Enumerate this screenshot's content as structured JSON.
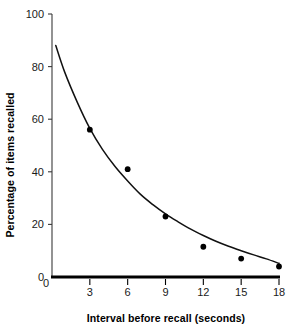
{
  "chart_data": {
    "type": "scatter",
    "title": "",
    "xlabel": "Interval before recall (seconds)",
    "ylabel": "Percentage of items recalled",
    "xlim": [
      0,
      18
    ],
    "ylim": [
      0,
      100
    ],
    "xticks": [
      0,
      3,
      6,
      9,
      12,
      15,
      18
    ],
    "xtick_labels": [
      "0",
      "3",
      "6",
      "9",
      "12",
      "15",
      "18"
    ],
    "yticks": [
      0,
      20,
      40,
      60,
      80,
      100
    ],
    "ytick_labels": [
      "0",
      "20",
      "40",
      "60",
      "80",
      "100"
    ],
    "grid": false,
    "legend": false,
    "series": [
      {
        "name": "Observed recall",
        "marker": "filled-circle",
        "color": "#000000",
        "x": [
          3,
          6,
          9,
          12,
          15,
          18
        ],
        "y": [
          56,
          41,
          23,
          11.5,
          7,
          4
        ]
      },
      {
        "name": "Fitted forgetting curve",
        "type": "line",
        "color": "#111111",
        "x": [
          0.3,
          1,
          2,
          3,
          4,
          5,
          6,
          7,
          8,
          9,
          10,
          11,
          12,
          13,
          14,
          15,
          16,
          17,
          18
        ],
        "y": [
          88,
          78,
          66.5,
          56.5,
          48.5,
          42,
          36.5,
          31.5,
          27.5,
          24,
          21,
          18.2,
          15.8,
          13.6,
          11.7,
          10,
          8.4,
          6.9,
          5.2
        ]
      }
    ]
  },
  "axis_titles": {
    "x": "Interval before recall (seconds)",
    "y": "Percentage of items recalled"
  },
  "geometry": {
    "x0_px": 52,
    "x18_px": 279,
    "y0_px": 277,
    "y100_px": 14
  }
}
